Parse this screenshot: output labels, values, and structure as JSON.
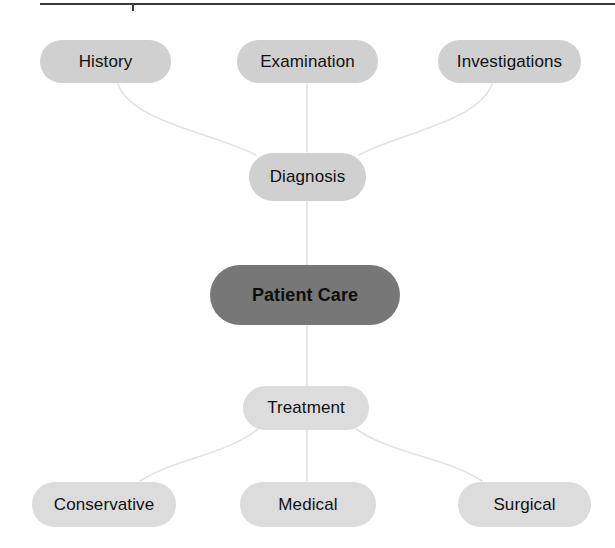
{
  "diagram": {
    "title": "Patient Care",
    "type": "mind-map",
    "center": {
      "id": "patient-care",
      "label": "Patient Care",
      "style": "dark",
      "color": "#777777"
    },
    "branches": [
      {
        "id": "diagnosis",
        "label": "Diagnosis",
        "position": "above-center",
        "color": "#d0d0d0",
        "children": [
          {
            "id": "history",
            "label": "History",
            "color": "#d4d4d4"
          },
          {
            "id": "examination",
            "label": "Examination",
            "color": "#d4d4d4"
          },
          {
            "id": "investigations",
            "label": "Investigations",
            "color": "#d4d4d4"
          }
        ]
      },
      {
        "id": "treatment",
        "label": "Treatment",
        "position": "below-center",
        "color": "#dcdcdc",
        "children": [
          {
            "id": "conservative",
            "label": "Conservative",
            "color": "#dcdcdc"
          },
          {
            "id": "medical",
            "label": "Medical",
            "color": "#dcdcdc"
          },
          {
            "id": "surgical",
            "label": "Surgical",
            "color": "#dcdcdc"
          }
        ]
      }
    ],
    "edges": [
      {
        "from": "history",
        "to": "diagnosis"
      },
      {
        "from": "examination",
        "to": "diagnosis"
      },
      {
        "from": "investigations",
        "to": "diagnosis"
      },
      {
        "from": "diagnosis",
        "to": "patient-care"
      },
      {
        "from": "patient-care",
        "to": "treatment"
      },
      {
        "from": "treatment",
        "to": "conservative"
      },
      {
        "from": "treatment",
        "to": "medical"
      },
      {
        "from": "treatment",
        "to": "surgical"
      }
    ],
    "rule": {
      "color": "#3a3a3a",
      "visible": true
    },
    "edge_color": "#e2e2e2",
    "background": "#ffffff"
  }
}
